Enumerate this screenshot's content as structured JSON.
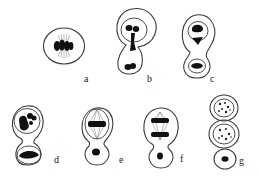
{
  "figure": {
    "colors": {
      "outline": "#3a3a3a",
      "chromatin": "#111111",
      "background": "#ffffff"
    },
    "panels": [
      {
        "id": "a",
        "label": "a",
        "stage": "metaphase, single round cell with spindle and chromosomes"
      },
      {
        "id": "b",
        "label": "b",
        "stage": "budding cell, chromatin stretched between mother and bud"
      },
      {
        "id": "c",
        "label": "c",
        "stage": "two nuclei, mother and bud separating"
      },
      {
        "id": "d",
        "label": "d",
        "stage": "mother nucleus with condensing chromatin, bud with flat nucleus"
      },
      {
        "id": "e",
        "label": "e",
        "stage": "metaphase plate in mother cell, small bud"
      },
      {
        "id": "f",
        "label": "f",
        "stage": "anaphase in mother cell, small bud"
      },
      {
        "id": "g",
        "label": "g",
        "stage": "chain of three cells: two with granular nuclei, one small"
      }
    ]
  }
}
